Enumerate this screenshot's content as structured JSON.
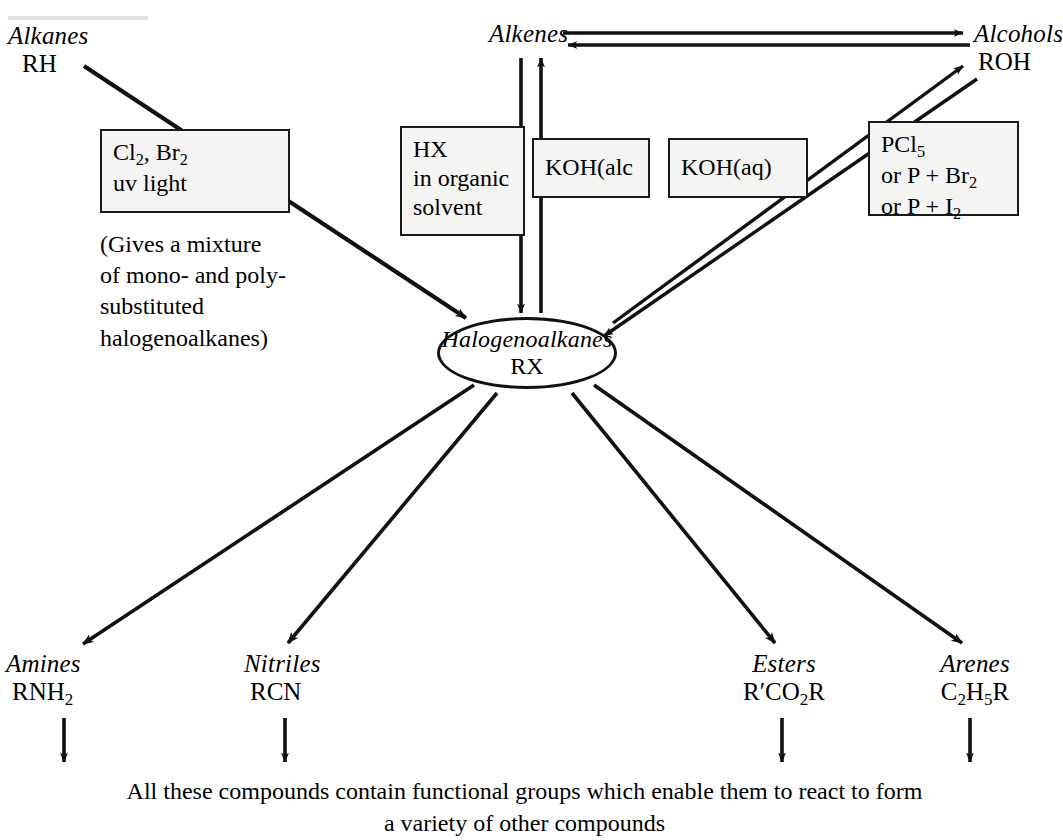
{
  "diagram": {
    "center": {
      "name": "Halogenoalkanes",
      "formula": "RX"
    },
    "nodes": {
      "alkanes": {
        "name": "Alkanes",
        "formula": "RH"
      },
      "alkenes": {
        "name": "Alkenes",
        "formula": ""
      },
      "alcohols": {
        "name": "Alcohols",
        "formula": "ROH"
      }
    },
    "reagent_boxes": {
      "halogenation": {
        "line1": "Cl",
        "line1_sub": "2",
        "line1_mid": ", Br",
        "line1_sub2": "2",
        "line2": "uv light"
      },
      "hx": {
        "line1": "HX",
        "line2": "in organic",
        "line3": "solvent"
      },
      "koh_alc": {
        "line1": "KOH(alc"
      },
      "koh_aq": {
        "line1": "KOH(aq)"
      },
      "phosphorus": {
        "line1": "PCl",
        "line1_sub": "5",
        "line2": "or P + Br",
        "line2_sub": "2",
        "line3": "or P + I",
        "line3_sub": "2"
      }
    },
    "note": {
      "line1": "(Gives a mixture",
      "line2": "of mono- and poly-",
      "line3": "substituted",
      "line4": "halogenoalkanes)"
    },
    "products": [
      {
        "name": "Amines",
        "formula_pre": "RNH",
        "formula_sub": "2",
        "formula_post": ""
      },
      {
        "name": "Nitriles",
        "formula_pre": "RCN",
        "formula_sub": "",
        "formula_post": ""
      },
      {
        "name": "Esters",
        "formula_pre": "R′CO",
        "formula_sub": "2",
        "formula_post": "R"
      },
      {
        "name": "Arenes",
        "formula_pre": "C",
        "formula_sub": "2",
        "formula_post": "H",
        "formula_sub2": "5",
        "formula_post2": "R"
      }
    ],
    "caption": {
      "line1": "All these compounds contain functional groups which enable them to react to form",
      "line2": "a variety of other compounds"
    },
    "colors": {
      "ink": "#111111",
      "box_fill": "#f4f4f2",
      "background": "#ffffff"
    }
  }
}
